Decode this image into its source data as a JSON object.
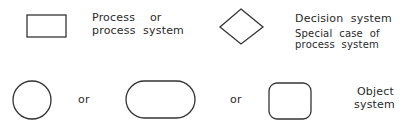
{
  "legend": {
    "process": {
      "shape": "rectangle",
      "label_line1": "Process    or",
      "label_line2": "process  system"
    },
    "decision": {
      "shape": "diamond",
      "label": "Decision  system",
      "note_line1": "Special  case  of",
      "note_line2": "process  system"
    },
    "object": {
      "shapes": [
        "circle",
        "stadium",
        "rounded-square"
      ],
      "or_1": "or",
      "or_2": "or",
      "label_line1": "Object",
      "label_line2": "system"
    }
  },
  "colors": {
    "stroke": "#333333",
    "background": "#ffffff"
  }
}
